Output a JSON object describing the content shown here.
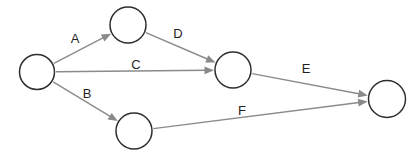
{
  "diagram": {
    "canvas": {
      "width": 419,
      "height": 163,
      "background": "#ffffff"
    },
    "styles": {
      "node_fill": "#ffffff",
      "node_stroke": "#2e2e2e",
      "node_stroke_width": 1.5,
      "edge_stroke": "#8a8a8a",
      "edge_stroke_width": 1.4,
      "arrow_fill": "#8a8a8a",
      "label_color": "#1f1f1f",
      "label_font_size": 13
    },
    "nodes": [
      {
        "id": "node-1",
        "cx": 37,
        "cy": 72,
        "r": 17.5
      },
      {
        "id": "node-2",
        "cx": 128,
        "cy": 25,
        "r": 18
      },
      {
        "id": "node-3",
        "cx": 134,
        "cy": 131,
        "r": 18
      },
      {
        "id": "node-4",
        "cx": 233,
        "cy": 70,
        "r": 18
      },
      {
        "id": "node-5",
        "cx": 387,
        "cy": 99,
        "r": 18.5
      }
    ],
    "edges": [
      {
        "label": "A",
        "from": "node-1",
        "to": "node-2",
        "label_x": 75,
        "label_y": 38
      },
      {
        "label": "B",
        "from": "node-1",
        "to": "node-3",
        "label_x": 87,
        "label_y": 93
      },
      {
        "label": "C",
        "from": "node-1",
        "to": "node-4",
        "label_x": 136,
        "label_y": 64.5
      },
      {
        "label": "D",
        "from": "node-2",
        "to": "node-4",
        "label_x": 178,
        "label_y": 33
      },
      {
        "label": "E",
        "from": "node-4",
        "to": "node-5",
        "label_x": 306,
        "label_y": 68
      },
      {
        "label": "F",
        "from": "node-3",
        "to": "node-5",
        "label_x": 242,
        "label_y": 110
      }
    ]
  }
}
